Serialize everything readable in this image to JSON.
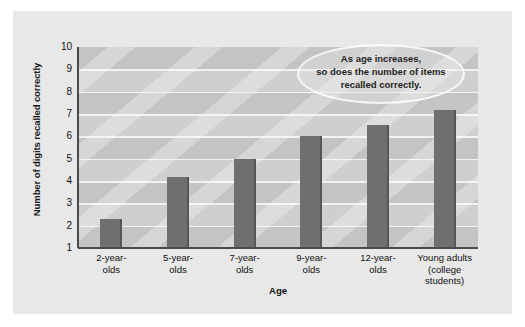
{
  "chart_data": {
    "type": "bar",
    "title": "",
    "xlabel": "Age",
    "ylabel": "Number of digits recalled correctly",
    "categories": [
      "2-year-\nolds",
      "5-year-\nolds",
      "7-year-\nolds",
      "9-year-\nolds",
      "12-year-\nolds",
      "Young adults\n(college\nstudents)"
    ],
    "values": [
      2.3,
      4.2,
      5.0,
      6.0,
      6.5,
      7.2
    ],
    "ylim": [
      1,
      10
    ],
    "yticks": [
      10,
      9,
      8,
      7,
      6,
      5,
      4,
      3,
      2,
      1
    ],
    "ytick_labels": [
      "10",
      "9",
      "8",
      "7",
      "6",
      "5",
      "4",
      "3",
      "2",
      "1"
    ],
    "grid": true,
    "legend": "none",
    "bar_color": "#6f6f6f",
    "plot_background": "#c9c9c9",
    "panel_background": "#e8e8e8",
    "annotations": [
      {
        "name": "trend-callout",
        "shape": "ellipse",
        "lines": [
          "As age increases,",
          "so does  the number of items",
          "recalled correctly."
        ]
      }
    ]
  },
  "axes": {
    "y_title": "Number of digits recalled correctly",
    "x_title": "Age"
  },
  "callout": {
    "line1": "As age increases,",
    "line2": "so does  the number of items",
    "line3": "recalled correctly."
  }
}
